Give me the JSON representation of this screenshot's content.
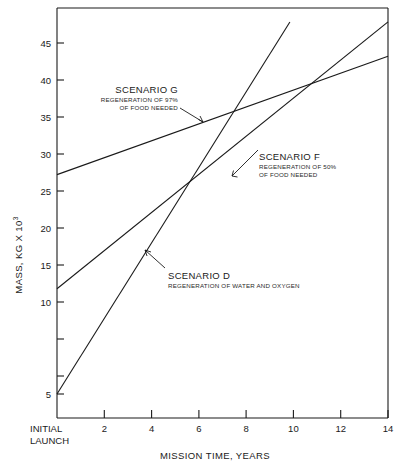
{
  "chart_data": {
    "type": "line",
    "title": "",
    "xlabel": "MISSION TIME, YEARS",
    "ylabel": "MASS, KG X 10",
    "ylabel_superscript": "3",
    "xlim": [
      0,
      14
    ],
    "ylim": [
      3,
      47.5
    ],
    "grid": false,
    "legend": "inline-annotations",
    "xticks": [
      0,
      2,
      4,
      6,
      8,
      10,
      12,
      14
    ],
    "xtick_labels": [
      "INITIAL LAUNCH",
      "2",
      "4",
      "6",
      "8",
      "10",
      "12",
      "14"
    ],
    "yticks": [
      5,
      10,
      15,
      20,
      25,
      30,
      35,
      40,
      45
    ],
    "ytick_labels": [
      "5",
      "10",
      "15",
      "20",
      "25",
      "30",
      "35",
      "40",
      "45"
    ],
    "origin_label_line1": "INITIAL",
    "origin_label_line2": "LAUNCH",
    "line_color": "#1a1a1a",
    "frame_color": "#1a1a1a",
    "series": [
      {
        "name": "SCENARIO G",
        "description_line1": "REGENERATION OF 97%",
        "description_line2": "OF FOOD NEEDED",
        "x": [
          0,
          14
        ],
        "y": [
          30.0,
          43.5
        ]
      },
      {
        "name": "SCENARIO F",
        "description_line1": "REGENERATION OF 50%",
        "description_line2": "OF FOOD NEEDED",
        "x": [
          0,
          14
        ],
        "y": [
          17.0,
          47.4
        ]
      },
      {
        "name": "SCENARIO D",
        "description_line1": "REGENERATION OF WATER AND OXYGEN",
        "description_line2": "",
        "x": [
          0,
          9.85
        ],
        "y": [
          5.0,
          47.4
        ]
      }
    ]
  }
}
